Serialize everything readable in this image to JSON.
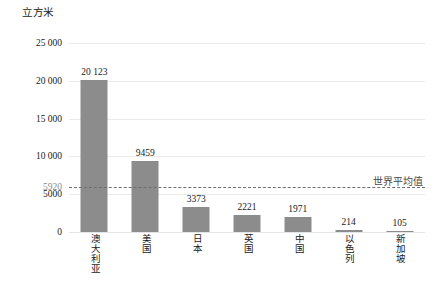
{
  "chart_data": {
    "type": "bar",
    "title": "",
    "subtitle": "",
    "xlabel": "",
    "ylabel": "立方米",
    "ylim": [
      0,
      25000
    ],
    "grid": true,
    "legend": null,
    "categories": [
      "澳大利亚",
      "美国",
      "日本",
      "英国",
      "中国",
      "以色列",
      "新加坡"
    ],
    "values": [
      20123,
      9459,
      3373,
      2221,
      1971,
      214,
      105
    ],
    "value_labels": [
      "20 123",
      "9459",
      "3373",
      "2221",
      "1971",
      "214",
      "105"
    ],
    "ytick_values": [
      0,
      5000,
      10000,
      15000,
      20000,
      25000
    ],
    "ytick_labels": [
      "0",
      "5000",
      "10 000",
      "15 000",
      "20 000",
      "25 000"
    ],
    "annotations": [
      {
        "name": "world-average",
        "label": "世界平均值",
        "value": 5920,
        "value_label": "5920",
        "style": "dashed-horizontal-line"
      }
    ],
    "colors": {
      "bar": "#8c8c8c",
      "gridline": "#e9eaec",
      "average_line": "#6f6f6f",
      "average_tick_text": "#8c8c8c",
      "text": "#1a1a1a",
      "background": "#ffffff"
    }
  }
}
